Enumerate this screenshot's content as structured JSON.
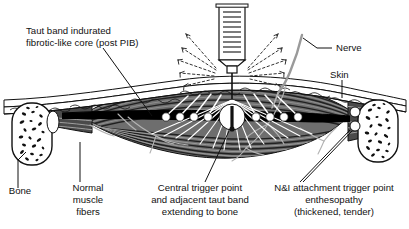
{
  "figure": {
    "background_color": "#ffffff",
    "ink_color": "#111111",
    "muscle_fill": "#6e6e6e",
    "muscle_dark": "#3a3a3a",
    "taut_band_color": "#000000",
    "nerve_color": "#9a9a9a",
    "knot_color": "#ffffff"
  },
  "labels": {
    "taut_band": {
      "lines": [
        "Taut band indurated",
        "fibrotic-like core (post PIB)"
      ],
      "anchor": "start"
    },
    "nerve": {
      "lines": [
        "Nerve"
      ],
      "anchor": "start"
    },
    "skin": {
      "lines": [
        "Skin"
      ],
      "anchor": "start"
    },
    "bone": {
      "lines": [
        "Bone"
      ],
      "anchor": "middle"
    },
    "normal_muscle_fibers": {
      "lines": [
        "Normal",
        "muscle",
        "fibers"
      ],
      "anchor": "middle"
    },
    "central_trigger_point": {
      "lines": [
        "Central trigger point",
        "and adjacent taut band",
        "extending to bone"
      ],
      "anchor": "middle"
    },
    "attachment_trigger_point": {
      "lines": [
        "N&I attachment trigger point",
        "enthesopathy",
        "(thickened, tender)"
      ],
      "anchor": "middle"
    }
  },
  "anatomy": {
    "syringe": {
      "name": "syringe",
      "graduation_marks": 9
    },
    "needle": {
      "name": "needle"
    },
    "spray_dashed_arrows": {
      "name": "needle-redirection-arrows",
      "count": 10
    },
    "fan_lines": {
      "name": "injection-fan-lines",
      "count": 14
    },
    "contraction_knots_left": {
      "count": 4
    },
    "contraction_knots_right": {
      "count": 4
    },
    "central_trigger_point_knot": {
      "count": 1
    },
    "attachment_knots_right": {
      "count": 2
    },
    "bones": {
      "count": 2,
      "pattern": "trabecular-speckle"
    }
  }
}
